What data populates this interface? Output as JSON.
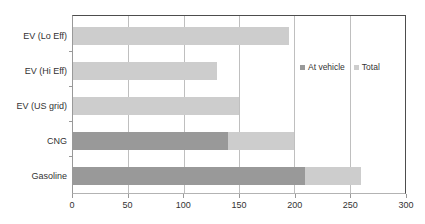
{
  "chart_data": {
    "type": "bar",
    "orientation": "horizontal",
    "title": "",
    "xlabel": "",
    "ylabel": "",
    "xlim": [
      0,
      300
    ],
    "ylim": null,
    "xticks": [
      0,
      50,
      100,
      150,
      200,
      250,
      300
    ],
    "xtick_labels": [
      "0",
      "50",
      "100",
      "150",
      "200",
      "250",
      "300"
    ],
    "grid": "vertical",
    "legend_position": "inside-right-upper",
    "categories": [
      "Gasoline",
      "CNG",
      "EV (US grid)",
      "EV (Hi Eff)",
      "EV (Lo Eff)"
    ],
    "categories_top_to_bottom": [
      "EV (Lo Eff)",
      "EV (Hi Eff)",
      "EV (US grid)",
      "CNG",
      "Gasoline"
    ],
    "series": [
      {
        "name": "At vehicle",
        "color": "#999999",
        "values_top_to_bottom": [
          0,
          0,
          0,
          140,
          210
        ]
      },
      {
        "name": "Total",
        "color": "#cdcdcd",
        "values_top_to_bottom": [
          195,
          130,
          150,
          200,
          260
        ]
      }
    ],
    "bars": [
      {
        "category": "EV (Lo Eff)",
        "at_vehicle": 0,
        "total": 195
      },
      {
        "category": "EV (Hi Eff)",
        "at_vehicle": 0,
        "total": 130
      },
      {
        "category": "EV (US grid)",
        "at_vehicle": 0,
        "total": 150
      },
      {
        "category": "CNG",
        "at_vehicle": 140,
        "total": 200
      },
      {
        "category": "Gasoline",
        "at_vehicle": 210,
        "total": 260
      }
    ]
  },
  "legend": {
    "items": [
      {
        "label": "At vehicle",
        "color": "#999999"
      },
      {
        "label": "Total",
        "color": "#cdcdcd"
      }
    ]
  },
  "axis": {
    "x_labels": [
      "0",
      "50",
      "100",
      "150",
      "200",
      "250",
      "300"
    ],
    "y_labels": [
      "EV (Lo Eff)",
      "EV (Hi Eff)",
      "EV (US grid)",
      "CNG",
      "Gasoline"
    ]
  },
  "colors": {
    "at_vehicle": "#999999",
    "total": "#cdcdcd",
    "gridline": "#bfbfbf",
    "frame": "#4d4d4d",
    "text": "#333333",
    "background": "#ffffff"
  }
}
